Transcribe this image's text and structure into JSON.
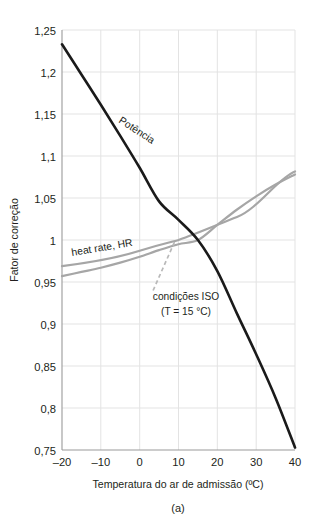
{
  "figure": {
    "caption": "(a)"
  },
  "chart_data": {
    "type": "line",
    "title": "",
    "xlabel": "Temperatura do ar de admissão (ºC)",
    "ylabel": "Fator de correção",
    "xlim": [
      -20,
      40
    ],
    "ylim": [
      0.75,
      1.25
    ],
    "xticks": [
      -20,
      -10,
      0,
      10,
      20,
      30,
      40
    ],
    "xtick_labels": [
      "–20",
      "–10",
      "0",
      "10",
      "20",
      "30",
      "40"
    ],
    "yticks": [
      0.75,
      0.8,
      0.85,
      0.9,
      0.95,
      1.0,
      1.05,
      1.1,
      1.15,
      1.2,
      1.25
    ],
    "ytick_labels": [
      "0,75",
      "0,8",
      "0,85",
      "0,9",
      "0,95",
      "1",
      "1,05",
      "1,1",
      "1,15",
      "1,2",
      "1,25"
    ],
    "grid": true,
    "legend": "inline-labels",
    "series": [
      {
        "name": "Potência",
        "label": "Potência",
        "color": "#1a1a1a",
        "width": 2.6,
        "style": "solid",
        "x": [
          -20,
          -15,
          -10,
          -5,
          0,
          5,
          10,
          15,
          20,
          25,
          30,
          35,
          40
        ],
        "y": [
          1.233,
          1.197,
          1.161,
          1.124,
          1.086,
          1.046,
          1.024,
          1.0,
          0.963,
          0.913,
          0.864,
          0.812,
          0.753
        ]
      },
      {
        "name": "heat rate, HR",
        "label": "heat rate, HR",
        "color": "#a6a6a6",
        "width": 2.2,
        "style": "solid",
        "x": [
          -20,
          -15,
          -10,
          -5,
          0,
          5,
          10,
          15,
          20,
          25,
          30,
          35,
          40
        ],
        "y": [
          0.957,
          0.962,
          0.967,
          0.973,
          0.98,
          0.988,
          0.995,
          1.0,
          1.018,
          1.036,
          1.052,
          1.066,
          1.078
        ]
      }
    ],
    "annotations": [
      {
        "name": "iso-conditions",
        "line1": "condições ISO",
        "line2": "(T = 15 °C)",
        "point_x": 15,
        "point_y": 1.0,
        "leader_style": "dashed",
        "leader_color": "#b3b3b3"
      }
    ],
    "colors": {
      "potencia": "#1a1a1a",
      "heat_rate": "#a6a6a6",
      "grid": "#e0e0e0",
      "axis": "#b0b0b0",
      "text": "#231f20"
    }
  }
}
